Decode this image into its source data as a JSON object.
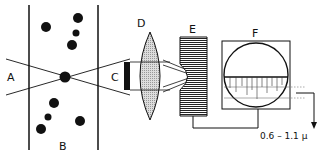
{
  "labels": {
    "A": "A",
    "B": "B",
    "C": "C",
    "D": "D",
    "E": "E",
    "F": "F",
    "range": "0.6 – 1.1 μ"
  }
}
